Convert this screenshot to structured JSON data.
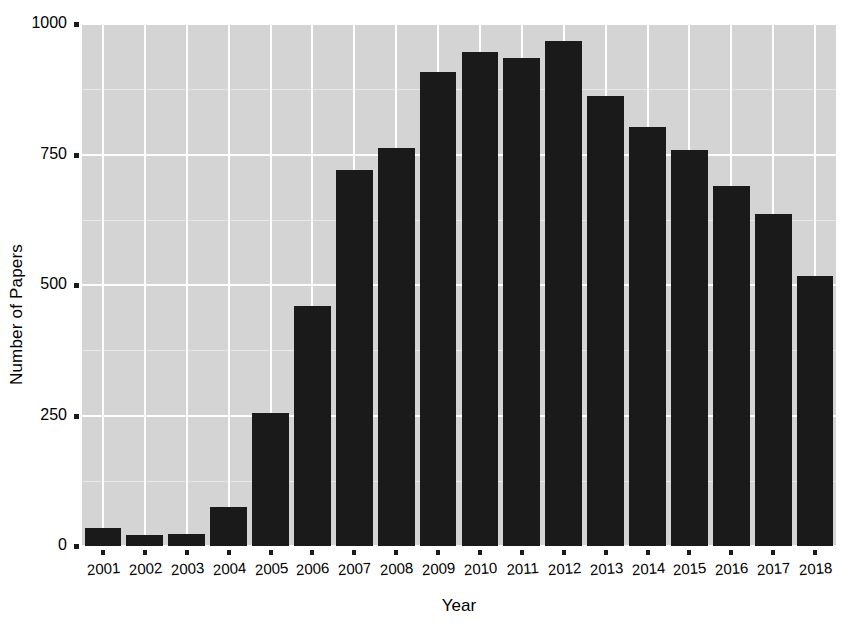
{
  "chart_data": {
    "type": "bar",
    "title": "",
    "xlabel": "Year",
    "ylabel": "Number of Papers",
    "categories": [
      "2001",
      "2002",
      "2003",
      "2004",
      "2005",
      "2006",
      "2007",
      "2008",
      "2009",
      "2010",
      "2011",
      "2012",
      "2013",
      "2014",
      "2015",
      "2016",
      "2017",
      "2018"
    ],
    "values": [
      35,
      21,
      23,
      75,
      255,
      460,
      721,
      763,
      908,
      947,
      935,
      968,
      862,
      803,
      758,
      690,
      637,
      518
    ],
    "ylim": [
      0,
      1000
    ],
    "yticks": [
      0,
      250,
      500,
      750,
      1000
    ],
    "ytick_labels": [
      "0",
      "250",
      "500",
      "750",
      "1000"
    ],
    "grid": true,
    "legend": false,
    "legend_position": "none",
    "bar_color": "#1a1a1a",
    "panel_color": "#d4d4d4",
    "grid_color": "#ffffff",
    "background_color": "#ffffff"
  }
}
